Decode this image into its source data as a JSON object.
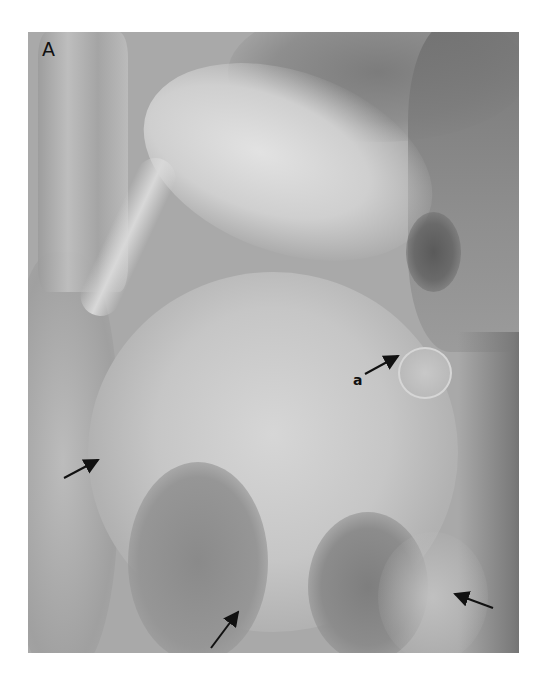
{
  "figure": {
    "panel_label": "A",
    "annotations": [
      {
        "label": "a",
        "description": "arrow pointing to rounded structure",
        "tail": [
          365,
          374
        ],
        "head": [
          398,
          356
        ]
      },
      {
        "arrow": 2,
        "tail": [
          64,
          478
        ],
        "head": [
          98,
          460
        ]
      },
      {
        "arrow": 3,
        "tail": [
          211,
          648
        ],
        "head": [
          238,
          612
        ]
      },
      {
        "arrow": 4,
        "tail": [
          493,
          608
        ],
        "head": [
          455,
          594
        ]
      }
    ],
    "colors": {
      "background": "#ffffff",
      "film_base": "#a9a9a9",
      "dark_region": "#6f6f6f",
      "bright_region": "#dcdcdc",
      "arrow": "#111111"
    }
  }
}
